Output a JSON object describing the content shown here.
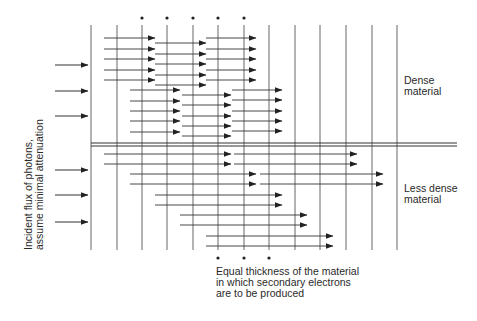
{
  "labels": {
    "side": [
      "Incident flux of photons,",
      "assume minimal attenuation"
    ],
    "dense": [
      "Dense",
      "material"
    ],
    "less_dense": [
      "Less dense",
      "material"
    ],
    "caption": [
      "Equal thickness of the material",
      "in which secondary electrons",
      "are to be produced"
    ]
  },
  "colors": {
    "line": "#333333",
    "text": "#2a2a2a",
    "background": "#ffffff"
  },
  "geometry": {
    "vertical_lines_x": [
      91,
      117,
      142,
      167,
      193,
      218,
      244,
      269,
      295,
      320,
      346,
      372,
      397
    ],
    "vertical_top": 25,
    "vertical_bottom": 250,
    "boundary_y": [
      143,
      146
    ],
    "boundary_x": [
      91,
      457
    ],
    "top_asterisks_x": [
      142,
      167,
      193,
      218,
      244
    ],
    "top_asterisk_y": 18,
    "bottom_asterisks_x": [
      218,
      244,
      269
    ],
    "bottom_asterisk_y": 258,
    "incident_arrows": [
      {
        "x1": 55,
        "x2": 88,
        "y": 65
      },
      {
        "x1": 55,
        "x2": 88,
        "y": 91
      },
      {
        "x1": 55,
        "x2": 88,
        "y": 116
      },
      {
        "x1": 55,
        "x2": 88,
        "y": 170
      },
      {
        "x1": 55,
        "x2": 88,
        "y": 195
      },
      {
        "x1": 55,
        "x2": 88,
        "y": 222
      }
    ],
    "dense_arrows": [
      {
        "x1": 104,
        "x2": 155,
        "y": 38
      },
      {
        "x1": 104,
        "x2": 155,
        "y": 49
      },
      {
        "x1": 104,
        "x2": 155,
        "y": 59
      },
      {
        "x1": 104,
        "x2": 155,
        "y": 70
      },
      {
        "x1": 104,
        "x2": 155,
        "y": 80
      },
      {
        "x1": 155,
        "x2": 206,
        "y": 43
      },
      {
        "x1": 155,
        "x2": 206,
        "y": 54
      },
      {
        "x1": 155,
        "x2": 206,
        "y": 64
      },
      {
        "x1": 155,
        "x2": 206,
        "y": 75
      },
      {
        "x1": 155,
        "x2": 206,
        "y": 85
      },
      {
        "x1": 206,
        "x2": 256,
        "y": 38
      },
      {
        "x1": 206,
        "x2": 256,
        "y": 49
      },
      {
        "x1": 206,
        "x2": 256,
        "y": 59
      },
      {
        "x1": 206,
        "x2": 256,
        "y": 70
      },
      {
        "x1": 206,
        "x2": 256,
        "y": 80
      },
      {
        "x1": 130,
        "x2": 180,
        "y": 90
      },
      {
        "x1": 130,
        "x2": 180,
        "y": 101
      },
      {
        "x1": 130,
        "x2": 180,
        "y": 111
      },
      {
        "x1": 130,
        "x2": 180,
        "y": 121
      },
      {
        "x1": 130,
        "x2": 180,
        "y": 132
      },
      {
        "x1": 182,
        "x2": 231,
        "y": 95
      },
      {
        "x1": 182,
        "x2": 231,
        "y": 105
      },
      {
        "x1": 182,
        "x2": 231,
        "y": 116
      },
      {
        "x1": 182,
        "x2": 231,
        "y": 126
      },
      {
        "x1": 182,
        "x2": 231,
        "y": 136
      },
      {
        "x1": 232,
        "x2": 282,
        "y": 90
      },
      {
        "x1": 232,
        "x2": 282,
        "y": 100
      },
      {
        "x1": 232,
        "x2": 282,
        "y": 111
      },
      {
        "x1": 232,
        "x2": 282,
        "y": 121
      },
      {
        "x1": 232,
        "x2": 282,
        "y": 131
      }
    ],
    "less_dense_arrows": [
      {
        "x1": 104,
        "x2": 231,
        "y": 154
      },
      {
        "x1": 104,
        "x2": 231,
        "y": 164
      },
      {
        "x1": 234,
        "x2": 357,
        "y": 154
      },
      {
        "x1": 234,
        "x2": 357,
        "y": 164
      },
      {
        "x1": 130,
        "x2": 256,
        "y": 174
      },
      {
        "x1": 130,
        "x2": 256,
        "y": 184
      },
      {
        "x1": 260,
        "x2": 383,
        "y": 174
      },
      {
        "x1": 260,
        "x2": 383,
        "y": 184
      },
      {
        "x1": 155,
        "x2": 282,
        "y": 195
      },
      {
        "x1": 155,
        "x2": 282,
        "y": 205
      },
      {
        "x1": 180,
        "x2": 307,
        "y": 215
      },
      {
        "x1": 180,
        "x2": 307,
        "y": 225
      },
      {
        "x1": 206,
        "x2": 333,
        "y": 236
      },
      {
        "x1": 206,
        "x2": 333,
        "y": 246
      }
    ]
  }
}
